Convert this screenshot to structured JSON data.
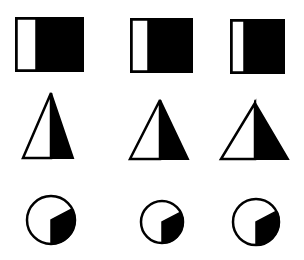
{
  "figure": {
    "colors": {
      "fill_dark": "#000000",
      "fill_light": "#ffffff",
      "stroke": "#000000",
      "background": "#ffffff"
    },
    "rows": [
      {
        "shape": "square",
        "items": [
          {
            "x": 15,
            "y": 17,
            "w": 69,
            "h": 55,
            "white_w": 20
          },
          {
            "x": 130,
            "y": 18,
            "w": 63,
            "h": 55,
            "white_w": 17
          },
          {
            "x": 230,
            "y": 19,
            "w": 55,
            "h": 55,
            "white_w": 13
          }
        ]
      },
      {
        "shape": "triangle",
        "items": [
          {
            "apex_x": 51,
            "apex_y": 93,
            "left": 23,
            "right": 73,
            "base_y": 158
          },
          {
            "apex_x": 160,
            "apex_y": 100,
            "left": 130,
            "right": 188,
            "base_y": 159
          },
          {
            "apex_x": 255,
            "apex_y": 103,
            "left": 221,
            "right": 288,
            "base_y": 159
          }
        ]
      },
      {
        "shape": "circle",
        "items": [
          {
            "cx": 51,
            "cy": 220,
            "r": 24
          },
          {
            "cx": 162,
            "cy": 222,
            "r": 21
          },
          {
            "cx": 256,
            "cy": 222,
            "r": 23
          }
        ]
      }
    ]
  }
}
